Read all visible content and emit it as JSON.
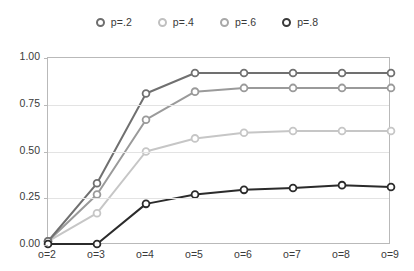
{
  "chart_data": {
    "type": "line",
    "title": "",
    "subtitle": "",
    "xlabel": "",
    "ylabel": "",
    "categories": [
      "o=2",
      "o=3",
      "o=4",
      "o=5",
      "o=6",
      "o=7",
      "o=8",
      "o=9"
    ],
    "x_tick_labels": [
      "o=2",
      "o=3",
      "o=4",
      "o=5",
      "o=6",
      "o=7",
      "o=8",
      "o=9"
    ],
    "y_tick_labels": [
      "0.00",
      "0.25",
      "0.50",
      "0.75",
      "1.00"
    ],
    "y_tick_values": [
      0.0,
      0.25,
      0.5,
      0.75,
      1.0
    ],
    "ylim": [
      0.0,
      1.0
    ],
    "grid": "horizontal",
    "legend_position": "top",
    "series": [
      {
        "name": "p=.2",
        "color": "#707070",
        "marker": "circle-open",
        "marker_fill": "#ffffff",
        "values": [
          0.02,
          0.33,
          0.81,
          0.92,
          0.92,
          0.92,
          0.92,
          0.92
        ]
      },
      {
        "name": "p=.4",
        "color": "#9a9a9a",
        "marker": "circle-open",
        "marker_fill": "#ffffff",
        "values": [
          0.02,
          0.27,
          0.67,
          0.82,
          0.84,
          0.84,
          0.84,
          0.84
        ]
      },
      {
        "name": "p=.6",
        "color": "#c6c6c6",
        "marker": "circle-open",
        "marker_fill": "#ffffff",
        "values": [
          0.02,
          0.17,
          0.5,
          0.57,
          0.6,
          0.61,
          0.61,
          0.61
        ]
      },
      {
        "name": "p=.8",
        "color": "#2b2b2b",
        "marker": "circle-open",
        "marker_fill": "#ffffff",
        "values": [
          0.005,
          0.005,
          0.22,
          0.27,
          0.295,
          0.305,
          0.32,
          0.31
        ]
      }
    ]
  },
  "legend": {
    "items": [
      {
        "label": "p=.2",
        "color": "#6e6e6e"
      },
      {
        "label": "p=.4",
        "color": "#c0c0c0"
      },
      {
        "label": "p=.6",
        "color": "#a8a8a8"
      },
      {
        "label": "p=.8",
        "color": "#3a3a3a"
      }
    ]
  },
  "colors": {
    "axis": "#b9b9b9",
    "grid": "#e3e3e3",
    "text": "#3a3a3a",
    "background": "#ffffff"
  }
}
